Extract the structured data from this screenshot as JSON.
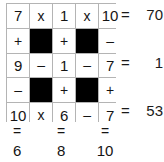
{
  "puzzle": {
    "type": "arithmetic-cross-sum-grid",
    "rows": 5,
    "cols": 5,
    "colors": {
      "background": "#ffffff",
      "grid_line": "#b4b4b4",
      "text": "#141414",
      "blocked_cell": "#000000"
    },
    "cells": [
      [
        {
          "text": "7",
          "kind": "number",
          "blocked": false
        },
        {
          "text": "x",
          "kind": "operator",
          "blocked": false
        },
        {
          "text": "1",
          "kind": "number",
          "blocked": false
        },
        {
          "text": "x",
          "kind": "operator",
          "blocked": false
        },
        {
          "text": "10",
          "kind": "number",
          "blocked": false
        }
      ],
      [
        {
          "text": "+",
          "kind": "operator",
          "blocked": false
        },
        {
          "text": "",
          "kind": "blocked",
          "blocked": true
        },
        {
          "text": "+",
          "kind": "operator",
          "blocked": false
        },
        {
          "text": "",
          "kind": "blocked",
          "blocked": true
        },
        {
          "text": "–",
          "kind": "operator",
          "blocked": false
        }
      ],
      [
        {
          "text": "9",
          "kind": "number",
          "blocked": false
        },
        {
          "text": "–",
          "kind": "operator",
          "blocked": false
        },
        {
          "text": "1",
          "kind": "number",
          "blocked": false
        },
        {
          "text": "–",
          "kind": "operator",
          "blocked": false
        },
        {
          "text": "7",
          "kind": "number",
          "blocked": false
        }
      ],
      [
        {
          "text": "–",
          "kind": "operator",
          "blocked": false
        },
        {
          "text": "",
          "kind": "blocked",
          "blocked": true
        },
        {
          "text": "+",
          "kind": "operator",
          "blocked": false
        },
        {
          "text": "",
          "kind": "blocked",
          "blocked": true
        },
        {
          "text": "+",
          "kind": "operator",
          "blocked": false
        }
      ],
      [
        {
          "text": "10",
          "kind": "number",
          "blocked": false
        },
        {
          "text": "x",
          "kind": "operator",
          "blocked": false
        },
        {
          "text": "6",
          "kind": "number",
          "blocked": false
        },
        {
          "text": "–",
          "kind": "operator",
          "blocked": false
        },
        {
          "text": "7",
          "kind": "number",
          "blocked": false
        }
      ]
    ],
    "row_results": [
      {
        "equals": "=",
        "value": "70",
        "grid_row": 1
      },
      {
        "equals": "=",
        "value": "1",
        "grid_row": 3
      },
      {
        "equals": "=",
        "value": "53",
        "grid_row": 5
      }
    ],
    "column_equals": [
      "=",
      "",
      "=",
      "",
      "="
    ],
    "column_results": [
      "6",
      "",
      "8",
      "",
      "10"
    ]
  }
}
